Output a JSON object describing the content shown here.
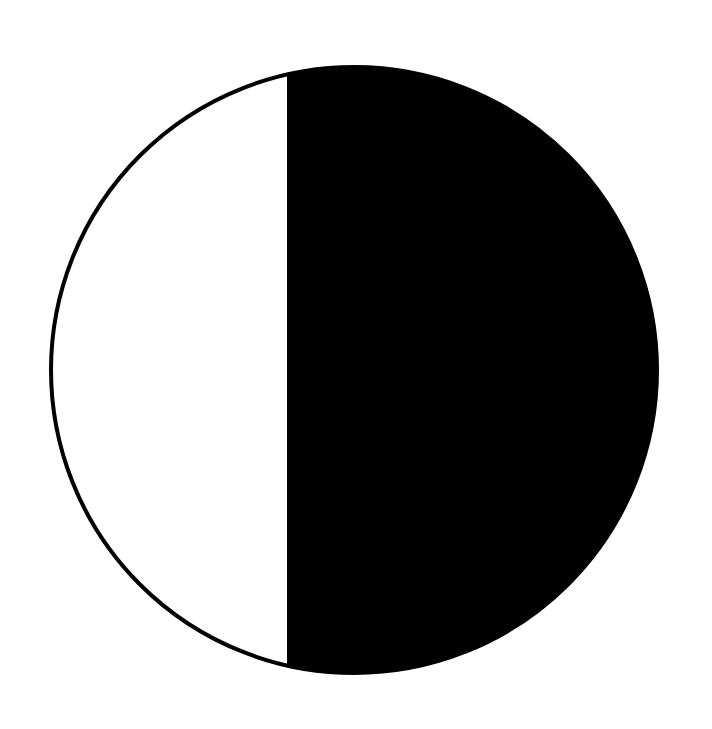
{
  "diagram": {
    "type": "moon-phase-symbol",
    "colors": {
      "background": "#ffffff",
      "fill": "#000000",
      "outline": "#000000",
      "light_part": "#ffffff"
    },
    "circle": {
      "cx": 354,
      "cy": 370,
      "r": 303
    },
    "divider_x": 287,
    "stroke_width": 4
  }
}
